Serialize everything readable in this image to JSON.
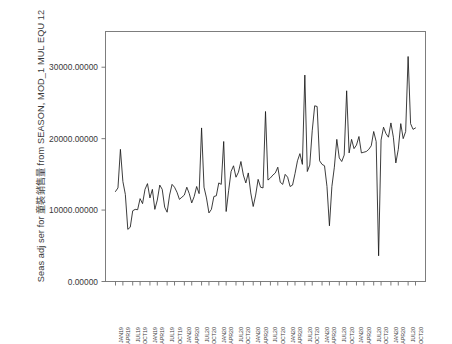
{
  "chart_data": {
    "type": "line",
    "title": "",
    "subtitle": "",
    "ylabel": "Seas adj ser for 童裝銷售量 from SEASON, MOD_1 MUL EQU 12",
    "xlabel": "",
    "ylim": [
      0,
      35000
    ],
    "grid": false,
    "legend": "none",
    "y_ticks": [
      0,
      10000,
      20000,
      30000
    ],
    "y_tick_labels": [
      "0.00000",
      "10000.00000",
      "20000.00000",
      "30000.00000"
    ],
    "x_tick_labels": [
      "JAN19",
      "APR19",
      "JUL19",
      "OCT19",
      "JAN19",
      "APR19",
      "JUL19",
      "OCT19",
      "JAN20",
      "APR20",
      "JUL20",
      "OCT20",
      "JAN20",
      "APR20",
      "JUL20",
      "OCT20",
      "JAN20",
      "APR20",
      "JUL20",
      "OCT20",
      "JAN20",
      "APR20",
      "JUL20",
      "OCT20",
      "JAN20",
      "APR20",
      "JUL20",
      "OCT20",
      "JAN20",
      "APR20",
      "JUL20",
      "OCT20",
      "JAN20",
      "APR20",
      "JUL20",
      "OCT20"
    ],
    "series": [
      {
        "name": "Seas adj ser for 童裝銷售量",
        "color": "#1a1a1a",
        "values": [
          12600,
          13100,
          18500,
          14000,
          12200,
          7300,
          7600,
          9900,
          10100,
          10050,
          11600,
          10900,
          12900,
          13700,
          11700,
          12900,
          10100,
          11400,
          13500,
          12900,
          10400,
          9700,
          12100,
          13600,
          13200,
          12500,
          11500,
          11800,
          12100,
          13200,
          12300,
          11000,
          11900,
          13300,
          12300,
          21500,
          13200,
          11700,
          9600,
          10100,
          11900,
          12000,
          13800,
          13600,
          19600,
          9800,
          12700,
          15400,
          16200,
          14600,
          15300,
          16800,
          14900,
          13800,
          15200,
          12400,
          10500,
          12100,
          14300,
          13200,
          13100,
          23800,
          14200,
          14500,
          14900,
          15200,
          16000,
          13900,
          13600,
          15000,
          14600,
          13300,
          13500,
          15100,
          16900,
          17900,
          16400,
          28900,
          15400,
          16300,
          21100,
          24600,
          24500,
          16900,
          16400,
          16200,
          13300,
          7800,
          13300,
          16000,
          19900,
          17300,
          16800,
          17700,
          26700,
          18000,
          19900,
          18600,
          19100,
          20300,
          18000,
          18100,
          18200,
          18500,
          19000,
          21000,
          19600,
          3600,
          19800,
          21600,
          20700,
          20200,
          22200,
          20200,
          16600,
          18500,
          22100,
          20000,
          21000,
          31500,
          22100,
          21300,
          21500
        ]
      }
    ]
  },
  "plot": {
    "frame_color": "#7d7d7d",
    "background": "#ffffff",
    "line_color": "#1a1a1a"
  }
}
